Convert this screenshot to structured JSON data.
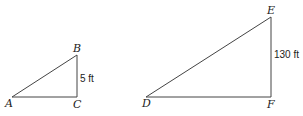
{
  "figure": {
    "small_triangle": {
      "vertices": {
        "A": "A",
        "B": "B",
        "C": "C"
      },
      "side_label": "5 ft"
    },
    "large_triangle": {
      "vertices": {
        "D": "D",
        "E": "E",
        "F": "F"
      },
      "side_label": "130 ft"
    },
    "line_color": "#444444"
  }
}
